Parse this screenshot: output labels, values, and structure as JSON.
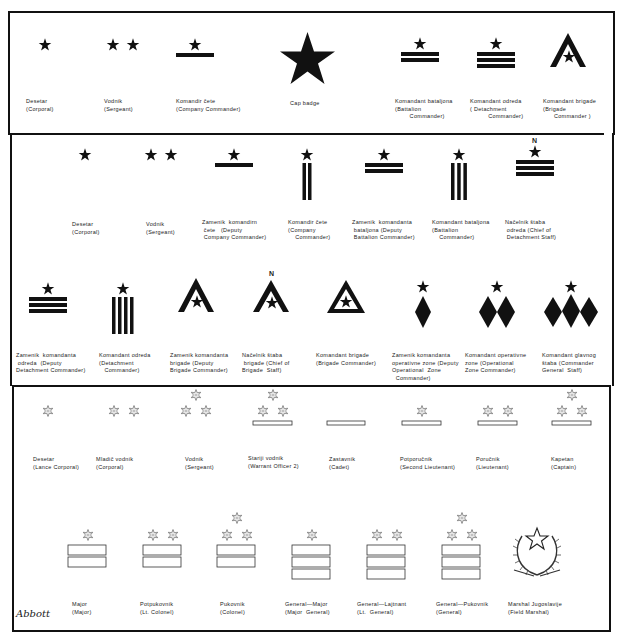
{
  "section1": {
    "items": [
      {
        "native": "Desetar",
        "english": "(Corporal)"
      },
      {
        "native": "Vodnik",
        "english": "(Sergeant)"
      },
      {
        "native": "Komandir čete",
        "english": "(Company Commander)"
      },
      {
        "native": "Cap badge",
        "english": ""
      },
      {
        "native": "Komandant bataljona",
        "english": "(Battalion\n        Commander)"
      },
      {
        "native": "Komandant odreda",
        "english": "( Detachment\n          Commander)"
      },
      {
        "native": "Komandant brigade",
        "english": "(Brigade\n      Commander )"
      }
    ]
  },
  "section2": {
    "row1": [
      {
        "native": "Desetar",
        "english": "(Corporal)"
      },
      {
        "native": "Vodnik",
        "english": "(Sergeant)"
      },
      {
        "native": "Zamenik  komandirn",
        "english": " čete   (Deputy\n Company Commander)"
      },
      {
        "native": "Komandir čete",
        "english": "(Company\n    Commander)"
      },
      {
        "native": "Zamenik  komandanta",
        "english": " bataljona (Deputy\n Battalion Commander)"
      },
      {
        "native": "Komandant bataljona",
        "english": "(Battalion\n    Commander)"
      },
      {
        "native": "Načelnik štaba",
        "english": " odreda (Chief of\n Detachment Staff)"
      }
    ],
    "row2": [
      {
        "native": "Zamenik  komandanta",
        "english": " odreda  (Deputy\nDetachment Commander)"
      },
      {
        "native": "Komandant odreda",
        "english": "(Detachment\n   Commander)"
      },
      {
        "native": "Zamenik komandanta",
        "english": "brigade (Deputy\nBrigade Commander)"
      },
      {
        "native": "Načelnik štaba",
        "english": " brigade (Chief of\nBrigade  Staff)"
      },
      {
        "native": "Komandant brigade",
        "english": "(Brigade Commander)"
      },
      {
        "native": "Zamenik komandanta",
        "english": "operativne zone (Deputy\nOperational  Zone\n  Commander)"
      },
      {
        "native": "Komandant operativne",
        "english": "zone (Operational\nZone Commander)"
      },
      {
        "native": "Komandant glavnog",
        "english": "štaba (Commander\nGeneral  Staff)"
      }
    ],
    "staff_marker": "N"
  },
  "section3": {
    "row1": [
      {
        "native": "Desetar",
        "english": "(Lance Corporal)"
      },
      {
        "native": "Mladič vodnik",
        "english": "(Corporal)"
      },
      {
        "native": "Vodnik",
        "english": "(Sergeant)"
      },
      {
        "native": "Stariji vodnik",
        "english": "(Warrant Officer 2)"
      },
      {
        "native": "Zastavnik",
        "english": "(Cadet)"
      },
      {
        "native": "Potporučnik",
        "english": "(Second Lieutenant)"
      },
      {
        "native": "Poručnik",
        "english": "(Lieutenant)"
      },
      {
        "native": "Kapetan",
        "english": "(Captain)"
      }
    ],
    "row2": [
      {
        "native": "Major",
        "english": "(Major)"
      },
      {
        "native": "Potpukovnik",
        "english": "(Lt. Colonel)"
      },
      {
        "native": "Pukovnik",
        "english": "(Colonel)"
      },
      {
        "native": "General—Major",
        "english": "(Major  General)"
      },
      {
        "native": "General—Lajtnant",
        "english": "(Lt.  General)"
      },
      {
        "native": "General—Pukovnik",
        "english": "(General)"
      },
      {
        "native": "Marshal Jugoslavije",
        "english": "(Field Marshal)"
      }
    ]
  },
  "signature": "Abbott",
  "colors": {
    "ink": "#111111",
    "paper": "#ffffff"
  }
}
